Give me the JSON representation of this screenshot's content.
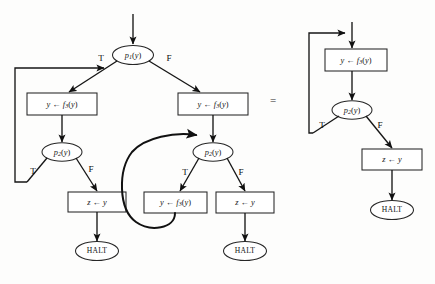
{
  "figure": {
    "relation_symbol": "=",
    "background_color": "#fdfdfc",
    "line_color": "#161616"
  },
  "labels": {
    "true_branch": "T",
    "false_branch": "F",
    "halt": "HALT",
    "assign_f3": "y ← f₃(y)",
    "assign_z": "z ← y",
    "pred_p1": "p₁(y)",
    "pred_p2": "p₂(y)"
  },
  "left_diagram": {
    "name": "original-program",
    "nodes": [
      {
        "id": "entry",
        "type": "entry",
        "label": "",
        "x": 133,
        "y": 12
      },
      {
        "id": "p1",
        "type": "decision",
        "label": "p₁(y)",
        "var": "p",
        "sub": "1",
        "arg": "(y)",
        "x": 133,
        "y": 57
      },
      {
        "id": "left-assign",
        "type": "process",
        "label": "y ← f₃(y)",
        "x": 62,
        "y": 104
      },
      {
        "id": "right-assign",
        "type": "process",
        "label": "y ← f₃(y)",
        "x": 212,
        "y": 104
      },
      {
        "id": "left-p2",
        "type": "decision",
        "label": "p₂(y)",
        "var": "p",
        "sub": "2",
        "arg": "(y)",
        "x": 62,
        "y": 153
      },
      {
        "id": "right-p2",
        "type": "decision",
        "label": "p₂(y)",
        "var": "p",
        "sub": "2",
        "arg": "(y)",
        "x": 212,
        "y": 153
      },
      {
        "id": "left-z",
        "type": "process",
        "label": "z ← y",
        "x": 97,
        "y": 203
      },
      {
        "id": "mid-assign",
        "type": "process",
        "label": "y ← f₃(y)",
        "x": 172,
        "y": 205
      },
      {
        "id": "right-z",
        "type": "process",
        "label": "z ← y",
        "x": 245,
        "y": 205
      },
      {
        "id": "left-halt",
        "type": "terminal",
        "label": "HALT",
        "x": 97,
        "y": 252
      },
      {
        "id": "right-halt",
        "type": "terminal",
        "label": "HALT",
        "x": 245,
        "y": 252
      }
    ],
    "edges": [
      {
        "from": "entry",
        "to": "p1",
        "label": ""
      },
      {
        "from": "p1",
        "to": "left-assign",
        "label": "T"
      },
      {
        "from": "p1",
        "to": "right-assign",
        "label": "F"
      },
      {
        "from": "left-assign",
        "to": "left-p2",
        "label": ""
      },
      {
        "from": "right-assign",
        "to": "right-p2",
        "label": ""
      },
      {
        "from": "left-p2",
        "to": "loopback-top",
        "label": "T"
      },
      {
        "from": "left-p2",
        "to": "left-z",
        "label": "F"
      },
      {
        "from": "right-p2",
        "to": "mid-assign",
        "label": "T"
      },
      {
        "from": "right-p2",
        "to": "right-z",
        "label": "F"
      },
      {
        "from": "mid-assign",
        "to": "right-p2",
        "label": ""
      },
      {
        "from": "left-z",
        "to": "left-halt",
        "label": ""
      },
      {
        "from": "right-z",
        "to": "right-halt",
        "label": ""
      }
    ]
  },
  "right_diagram": {
    "name": "reduced-program",
    "nodes": [
      {
        "id": "entry2",
        "type": "entry",
        "label": "",
        "x": 353,
        "y": 20
      },
      {
        "id": "assign2",
        "type": "process",
        "label": "y ← f₃(y)",
        "x": 353,
        "y": 60
      },
      {
        "id": "p2b",
        "type": "decision",
        "label": "p₂(y)",
        "var": "p",
        "sub": "2",
        "arg": "(y)",
        "x": 353,
        "y": 110
      },
      {
        "id": "z2",
        "type": "process",
        "label": "z ← y",
        "x": 392,
        "y": 160
      },
      {
        "id": "halt2",
        "type": "terminal",
        "label": "HALT",
        "x": 392,
        "y": 211
      }
    ],
    "edges": [
      {
        "from": "entry2",
        "to": "assign2",
        "label": ""
      },
      {
        "from": "assign2",
        "to": "p2b",
        "label": ""
      },
      {
        "from": "p2b",
        "to": "assign2",
        "label": "T"
      },
      {
        "from": "p2b",
        "to": "z2",
        "label": "F"
      },
      {
        "from": "z2",
        "to": "halt2",
        "label": ""
      }
    ]
  }
}
